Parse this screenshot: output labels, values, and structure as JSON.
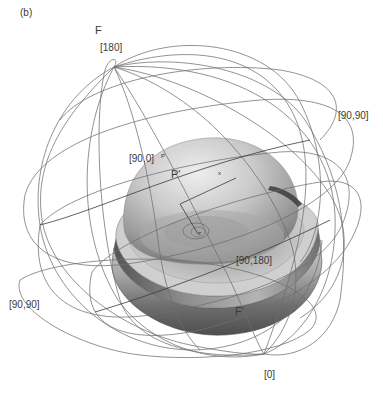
{
  "panel_label": "(b)",
  "labels": {
    "F": "F",
    "F_prime": "F'",
    "pole_top": "[180]",
    "pole_bottom": "[0]",
    "right_90_90": "[90,90]",
    "left_90_90": "[90,90]",
    "node_90_0": "[90,0]",
    "node_90_180": "[90,180]",
    "P_small": "P",
    "P_prime": "P'",
    "axis_x": "x",
    "axis_z": "z"
  },
  "colors": {
    "wire": "#6e6e6e",
    "text": "#3a3a3a",
    "dome_light": "#e2e2e2",
    "dome_mid": "#b5b5b5",
    "dome_dark": "#6b6b6b",
    "rim_dark": "#5a5a5a"
  }
}
